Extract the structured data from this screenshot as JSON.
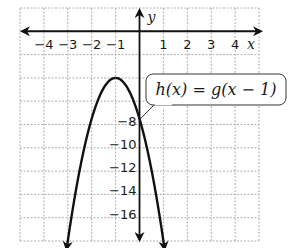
{
  "chart_data": {
    "type": "line",
    "title": "",
    "xlabel": "x",
    "ylabel": "y",
    "xlim": [
      -5,
      5
    ],
    "ylim": [
      -18,
      2
    ],
    "grid": true,
    "x_tick_labels": [
      "−4",
      "−3",
      "−2",
      "−1",
      "1",
      "2",
      "3",
      "4"
    ],
    "x_tick_values": [
      -4,
      -3,
      -2,
      -1,
      1,
      2,
      3,
      4
    ],
    "y_tick_labels": [
      "−8",
      "−10",
      "−12",
      "−14",
      "−16"
    ],
    "y_tick_values": [
      -8,
      -10,
      -12,
      -14,
      -16
    ],
    "series": [
      {
        "name": "h(x) = g(x − 1)",
        "shape": "downward parabola",
        "vertex": [
          -1,
          -4
        ],
        "y_intercept": -7.5,
        "x": [
          -3.05,
          -2.5,
          -2,
          -1.5,
          -1,
          -0.5,
          0,
          0.5,
          1.05
        ],
        "y": [
          -17.6,
          -11.7,
          -7.3,
          -4.8,
          -4,
          -4.8,
          -7.3,
          -11.7,
          -17.6
        ]
      }
    ],
    "annotations": [
      {
        "text": "h(x) = g(x − 1)",
        "points_to": [
          0,
          -7.5
        ]
      }
    ]
  },
  "labels": {
    "x_axis": "x",
    "y_axis": "y",
    "callout": "h(x) = g(x − 1)"
  }
}
